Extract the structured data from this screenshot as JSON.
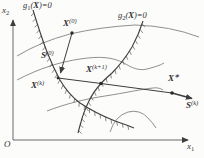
{
  "figure": {
    "background": "#fcfcfb",
    "ink_color": "#3e3e3e",
    "contour_color": "#747474",
    "axis_color": "#5a5a5a",
    "hatch_color": "#5c5c5c",
    "description_labels": {
      "origin": "O",
      "axis_x": {
        "base": "x",
        "sub": "1"
      },
      "axis_y": {
        "base": "x",
        "sub": "2"
      },
      "g1": {
        "fn": "g",
        "sub": "1",
        "open": "(",
        "var": "X",
        "close": ")=0"
      },
      "g2": {
        "fn": "g",
        "sub": "2",
        "open": "(",
        "var": "X",
        "close": ")=0"
      },
      "x0": {
        "var": "X",
        "sup": "(0)"
      },
      "s0": {
        "var": "S",
        "sup": "(0)"
      },
      "xk": {
        "var": "X",
        "sup": "(k)"
      },
      "xk1": {
        "var": "X",
        "sup": "(k+1)"
      },
      "xstar": {
        "var": "X",
        "sup": "∗"
      },
      "sk": {
        "var": "S",
        "sup": "(k)"
      }
    }
  }
}
